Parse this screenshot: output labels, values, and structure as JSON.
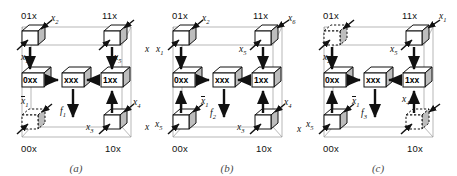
{
  "figure": {
    "type": "three-panel cube diagram",
    "background": "#ffffff",
    "line_color": "#111111",
    "frame_color": "#9a9a9a",
    "cube_shade": "#bdbdbd"
  },
  "panels": [
    {
      "id": "a",
      "caption": "(a)",
      "output_label": "f",
      "output_sub": "1",
      "center_cube": "xxx",
      "left_cube": "0xx",
      "right_cube": "1xx",
      "corners": [
        {
          "name": "01x",
          "position": "top-left",
          "style": "solid",
          "label": "01x"
        },
        {
          "name": "11x",
          "position": "top-right",
          "style": "solid",
          "label": "11x"
        },
        {
          "name": "00x",
          "position": "bottom-left",
          "style": "dashed",
          "label": "00x"
        },
        {
          "name": "10x",
          "position": "bottom-right",
          "style": "solid",
          "label": "10x"
        }
      ],
      "edge_labels": [
        {
          "name": "top-left-diagonal",
          "text": "x",
          "sub": "2",
          "bar": false
        },
        {
          "name": "left-upper-vertical",
          "text": "x",
          "sub": "1",
          "bar": false
        },
        {
          "name": "left-lower-diagonal",
          "text": "x",
          "sub": "1",
          "bar": true
        },
        {
          "name": "right-upper-vertical",
          "text": "x",
          "sub": "5",
          "bar": false
        },
        {
          "name": "right-lower-diagonal",
          "text": "x",
          "sub": "4",
          "bar": false
        },
        {
          "name": "bottom-right-side",
          "text": "x",
          "sub": "3",
          "bar": false
        }
      ]
    },
    {
      "id": "b",
      "caption": "(b)",
      "output_label": "f",
      "output_sub": "2",
      "center_cube": "xxx",
      "left_cube": "0xx",
      "right_cube": "1xx",
      "corners": [
        {
          "name": "01x",
          "position": "top-left",
          "style": "solid",
          "label": "01x"
        },
        {
          "name": "11x",
          "position": "top-right",
          "style": "solid",
          "label": "11x"
        },
        {
          "name": "00x",
          "position": "bottom-left",
          "style": "solid",
          "label": "00x"
        },
        {
          "name": "10x",
          "position": "bottom-right",
          "style": "solid",
          "label": "10x"
        }
      ],
      "edge_labels": [
        {
          "name": "top-left-diagonal",
          "text": "x",
          "sub": "2",
          "bar": false
        },
        {
          "name": "top-left-side",
          "text": "x",
          "sub": "1",
          "bar": false
        },
        {
          "name": "top-right-diagonal",
          "text": "x",
          "sub": "6",
          "bar": false
        },
        {
          "name": "right-upper-side",
          "text": "x",
          "sub": "5",
          "bar": false
        },
        {
          "name": "left-lower-diagonal",
          "text": "x",
          "sub": "1",
          "bar": true
        },
        {
          "name": "bottom-left-side",
          "text": "x",
          "sub": "5",
          "bar": false
        },
        {
          "name": "right-lower-diagonal",
          "text": "x",
          "sub": "4",
          "bar": false
        },
        {
          "name": "bottom-right-side",
          "text": "x",
          "sub": "3",
          "bar": false
        }
      ]
    },
    {
      "id": "c",
      "caption": "(c)",
      "output_label": "f",
      "output_sub": "3",
      "center_cube": "xxx",
      "left_cube": "0xx",
      "right_cube": "1xx",
      "corners": [
        {
          "name": "01x",
          "position": "top-left",
          "style": "dashed",
          "label": "01x"
        },
        {
          "name": "11x",
          "position": "top-right",
          "style": "solid",
          "label": "11x"
        },
        {
          "name": "00x",
          "position": "bottom-left",
          "style": "solid",
          "label": "00x"
        },
        {
          "name": "10x",
          "position": "bottom-right",
          "style": "dashed",
          "label": "10x"
        }
      ],
      "edge_labels": [
        {
          "name": "top-right-diagonal",
          "text": "x",
          "sub": "1",
          "bar": false
        },
        {
          "name": "right-upper-side",
          "text": "x",
          "sub": "5",
          "bar": false
        },
        {
          "name": "left-upper-vertical",
          "text": "x",
          "sub": "2",
          "bar": false
        },
        {
          "name": "left-lower-diagonal",
          "text": "x",
          "sub": "1",
          "bar": true
        },
        {
          "name": "bottom-left-side",
          "text": "x",
          "sub": "5",
          "bar": false
        },
        {
          "name": "right-lower-vertical",
          "text": "x",
          "sub": "4",
          "bar": false
        }
      ]
    }
  ]
}
